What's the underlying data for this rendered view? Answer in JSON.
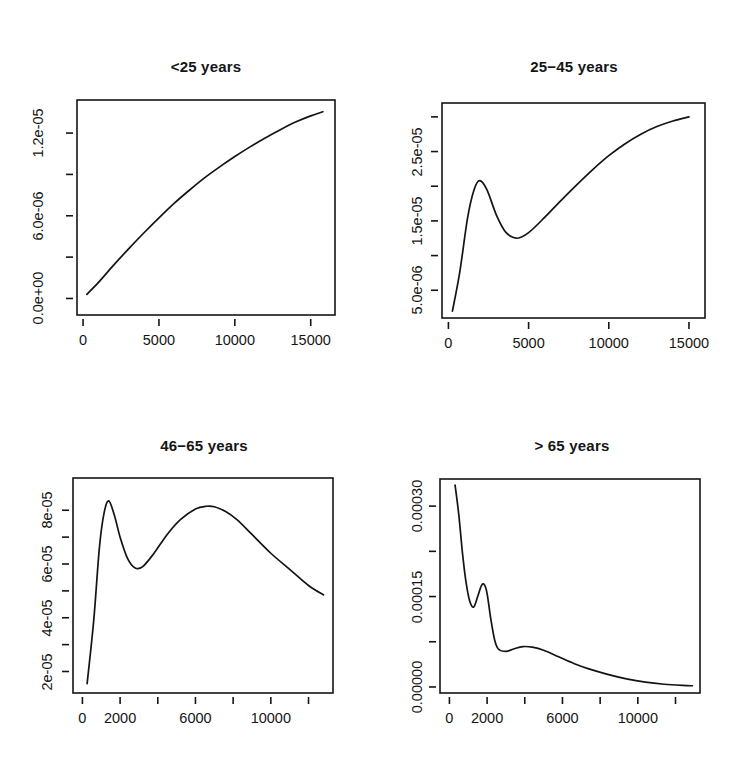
{
  "figure": {
    "background": "#ffffff",
    "ink_color": "#141414",
    "layout": "2x2 panel grid of kernel density estimates"
  },
  "chart_data": [
    {
      "type": "line",
      "title": "<25 years",
      "xlabel": "",
      "ylabel": "",
      "grid": false,
      "legend": "none",
      "xlim": [
        -400,
        16600
      ],
      "ylim": [
        -1.2e-06,
        1.44e-05
      ],
      "xticks": [
        0,
        5000,
        10000,
        15000
      ],
      "xticklabels": [
        "0",
        "5000",
        "10000",
        "15000"
      ],
      "yticks": [
        0.0,
        3e-06,
        6e-06,
        9e-06,
        1.2e-05
      ],
      "yticklabels": [
        "0.0e+00",
        "",
        "6.0e-06",
        "",
        "1.2e-05"
      ],
      "ylabels_shown": [
        "0.0e+00",
        "6.0e-06",
        "1.2e-05"
      ],
      "x": [
        250,
        1000,
        2000,
        3000,
        4000,
        5000,
        6000,
        7000,
        8000,
        9000,
        10000,
        11000,
        12000,
        13000,
        14000,
        15000,
        15800
      ],
      "y": [
        3e-07,
        1.15e-06,
        2.4e-06,
        3.6e-06,
        4.75e-06,
        5.85e-06,
        6.9e-06,
        7.85e-06,
        8.75e-06,
        9.55e-06,
        1.03e-05,
        1.1e-05,
        1.165e-05,
        1.225e-05,
        1.28e-05,
        1.325e-05,
        1.355e-05
      ]
    },
    {
      "type": "line",
      "title": "25−45 years",
      "xlabel": "",
      "ylabel": "",
      "grid": false,
      "legend": "none",
      "xlim": [
        -400,
        16000
      ],
      "ylim": [
        1e-06,
        3.2e-05
      ],
      "xticks": [
        0,
        5000,
        10000,
        15000
      ],
      "xticklabels": [
        "0",
        "5000",
        "10000",
        "15000"
      ],
      "yticks": [
        5e-06,
        1e-05,
        1.5e-05,
        2e-05,
        2.5e-05,
        3e-05
      ],
      "yticklabels": [
        "5.0e-06",
        "",
        "1.5e-05",
        "",
        "2.5e-05",
        ""
      ],
      "ylabels_shown": [
        "5.0e-06",
        "1.5e-05",
        "2.5e-05"
      ],
      "x": [
        250,
        700,
        1200,
        1600,
        1950,
        2400,
        3000,
        3600,
        4300,
        5000,
        6000,
        7000,
        8000,
        9000,
        10000,
        11000,
        12000,
        13000,
        14000,
        15000
      ],
      "y": [
        2e-06,
        7.5e-06,
        1.55e-05,
        1.95e-05,
        2.08e-05,
        1.95e-05,
        1.58e-05,
        1.33e-05,
        1.25e-05,
        1.33e-05,
        1.55e-05,
        1.79e-05,
        2.02e-05,
        2.24e-05,
        2.44e-05,
        2.61e-05,
        2.75e-05,
        2.86e-05,
        2.94e-05,
        3e-05
      ]
    },
    {
      "type": "line",
      "title": "46−65 years",
      "xlabel": "",
      "ylabel": "",
      "grid": false,
      "legend": "none",
      "xlim": [
        -500,
        13300
      ],
      "ylim": [
        1.2e-05,
        9.2e-05
      ],
      "xticks": [
        0,
        2000,
        4000,
        6000,
        8000,
        10000,
        12000
      ],
      "xticklabels": [
        "0",
        "2000",
        "",
        "6000",
        "",
        "10000",
        ""
      ],
      "xlabels_shown": [
        "0",
        "2000",
        "6000",
        "10000"
      ],
      "yticks": [
        2e-05,
        3e-05,
        4e-05,
        5e-05,
        6e-05,
        7e-05,
        8e-05
      ],
      "yticklabels": [
        "2e-05",
        "",
        "4e-05",
        "",
        "6e-05",
        "",
        "8e-05"
      ],
      "ylabels_shown": [
        "2e-05",
        "4e-05",
        "6e-05",
        "8e-05"
      ],
      "x": [
        250,
        600,
        900,
        1150,
        1400,
        1700,
        2000,
        2400,
        2800,
        3200,
        3800,
        4500,
        5200,
        6000,
        6600,
        7000,
        7600,
        8200,
        9000,
        10000,
        11000,
        12000,
        12800
      ],
      "y": [
        1.55e-05,
        3.9e-05,
        6.6e-05,
        7.9e-05,
        8.35e-05,
        7.8e-05,
        7e-05,
        6.2e-05,
        5.85e-05,
        5.9e-05,
        6.4e-05,
        7.1e-05,
        7.65e-05,
        8.05e-05,
        8.15e-05,
        8.13e-05,
        7.95e-05,
        7.65e-05,
        7.1e-05,
        6.4e-05,
        5.8e-05,
        5.2e-05,
        4.85e-05
      ]
    },
    {
      "type": "line",
      "title": "> 65 years",
      "xlabel": "",
      "ylabel": "",
      "grid": false,
      "legend": "none",
      "xlim": [
        -500,
        13300
      ],
      "ylim": [
        -1e-05,
        0.000345
      ],
      "xticks": [
        0,
        2000,
        4000,
        6000,
        8000,
        10000,
        12000
      ],
      "xticklabels": [
        "0",
        "2000",
        "",
        "6000",
        "",
        "10000",
        ""
      ],
      "xlabels_shown": [
        "0",
        "2000",
        "6000",
        "10000"
      ],
      "yticks": [
        0.0,
        7.5e-05,
        0.00015,
        0.000225,
        0.0003
      ],
      "yticklabels": [
        "0.00000",
        "",
        "0.00015",
        "",
        "0.00030"
      ],
      "ylabels_shown": [
        "0.00000",
        "0.00015",
        "0.00030"
      ],
      "x": [
        300,
        500,
        700,
        900,
        1100,
        1300,
        1500,
        1700,
        1850,
        2000,
        2200,
        2400,
        2600,
        3000,
        3400,
        3900,
        4400,
        5000,
        5800,
        6600,
        7400,
        8400,
        9400,
        10400,
        11400,
        12400,
        12900
      ],
      "y": [
        0.000335,
        0.000285,
        0.00022,
        0.00017,
        0.00014,
        0.000133,
        0.00015,
        0.000168,
        0.00017,
        0.000155,
        0.000112,
        7.8e-05,
        6.3e-05,
        5.9e-05,
        6.3e-05,
        6.7e-05,
        6.6e-05,
        6.1e-05,
        5e-05,
        3.9e-05,
        3e-05,
        2.1e-05,
        1.35e-05,
        8e-06,
        4.5e-06,
        2.5e-06,
        2e-06
      ]
    }
  ]
}
